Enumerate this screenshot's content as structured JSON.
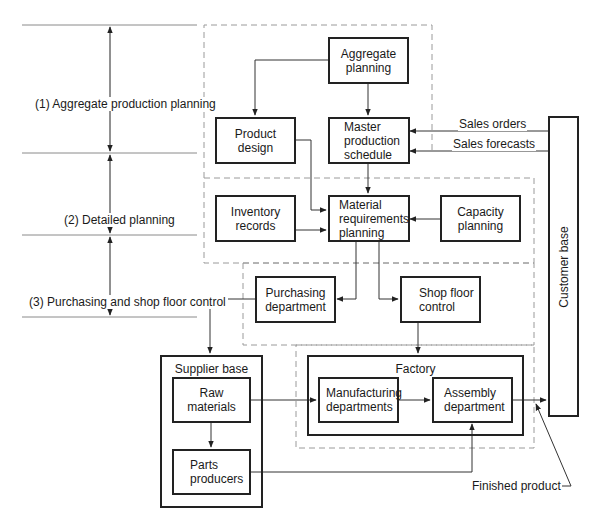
{
  "phases": [
    {
      "id": "aggregate",
      "label": "(1) Aggregate production planning"
    },
    {
      "id": "detailed",
      "label": "(2) Detailed planning"
    },
    {
      "id": "purchasing",
      "label": "(3) Purchasing and shop floor control"
    }
  ],
  "nodes": {
    "aggregate_planning": "Aggregate\nplanning",
    "product_design": "Product\ndesign",
    "master_production_schedule": "Master\nproduction\nschedule",
    "inventory_records": "Inventory\nrecords",
    "material_requirements_planning": "Material\nrequirements\nplanning",
    "capacity_planning": "Capacity\nplanning",
    "purchasing_department": "Purchasing\ndepartment",
    "shop_floor_control": "Shop floor\ncontrol",
    "raw_materials": "Raw materials",
    "parts_producers": "Parts\nproducers",
    "manufacturing_departments": "Manufacturing\ndepartments",
    "assembly_department": "Assembly\ndepartment"
  },
  "containers": {
    "supplier_base": "Supplier base",
    "factory": "Factory",
    "customer_base": "Customer base"
  },
  "flow_labels": {
    "sales_orders": "Sales orders",
    "sales_forecasts": "Sales forecasts",
    "finished_product": "Finished product"
  },
  "edges": [
    {
      "from": "Aggregate planning",
      "to": "Product design"
    },
    {
      "from": "Aggregate planning",
      "to": "Master production schedule"
    },
    {
      "from": "Customer base",
      "to": "Master production schedule",
      "label": "Sales orders"
    },
    {
      "from": "Customer base",
      "to": "Master production schedule",
      "label": "Sales forecasts"
    },
    {
      "from": "Product design",
      "to": "Material requirements planning"
    },
    {
      "from": "Master production schedule",
      "to": "Material requirements planning"
    },
    {
      "from": "Inventory records",
      "to": "Material requirements planning"
    },
    {
      "from": "Capacity planning",
      "to": "Material requirements planning"
    },
    {
      "from": "Material requirements planning",
      "to": "Purchasing department"
    },
    {
      "from": "Material requirements planning",
      "to": "Shop floor control"
    },
    {
      "from": "Purchasing department",
      "to": "Supplier base"
    },
    {
      "from": "Shop floor control",
      "to": "Factory"
    },
    {
      "from": "Raw materials",
      "to": "Parts producers"
    },
    {
      "from": "Raw materials",
      "to": "Manufacturing departments"
    },
    {
      "from": "Manufacturing departments",
      "to": "Assembly department"
    },
    {
      "from": "Parts producers",
      "to": "Assembly department"
    },
    {
      "from": "Assembly department",
      "to": "Customer base",
      "label": "Finished product"
    }
  ],
  "colors": {
    "line": "#222222",
    "dashed": "#9a9a9a",
    "separator": "#8a8a8a",
    "background": "#ffffff"
  }
}
